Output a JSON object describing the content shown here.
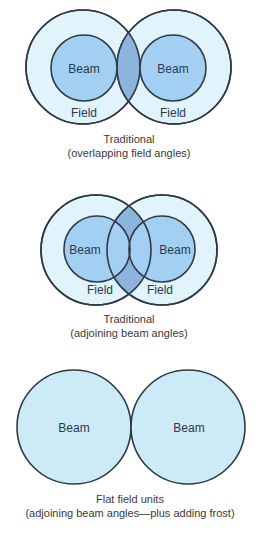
{
  "colors": {
    "field_fill": "#e1f3fb",
    "beam_fill": "#a3cff3",
    "overlap_fill": "#8db4dc",
    "flat_beam_fill": "#cdebf7",
    "stroke": "#2f3a45",
    "label_text": "#2a3a4e",
    "caption_text": "#3a3a3a"
  },
  "panels": [
    {
      "id": "traditional-overlapping",
      "labels": {
        "beam_left": "Beam",
        "beam_right": "Beam",
        "field_left": "Field",
        "field_right": "Field"
      },
      "caption": {
        "line1": "Traditional",
        "line2": "(overlapping field angles)"
      }
    },
    {
      "id": "traditional-adjoining",
      "labels": {
        "beam_left": "Beam",
        "beam_right": "Beam",
        "field_left": "Field",
        "field_right": "Field"
      },
      "caption": {
        "line1": "Traditional",
        "line2": "(adjoining beam angles)"
      }
    },
    {
      "id": "flat-field",
      "labels": {
        "beam_left": "Beam",
        "beam_right": "Beam"
      },
      "caption": {
        "line1": "Flat field units",
        "line2": "(adjoining beam angles—plus adding frost)"
      }
    }
  ]
}
